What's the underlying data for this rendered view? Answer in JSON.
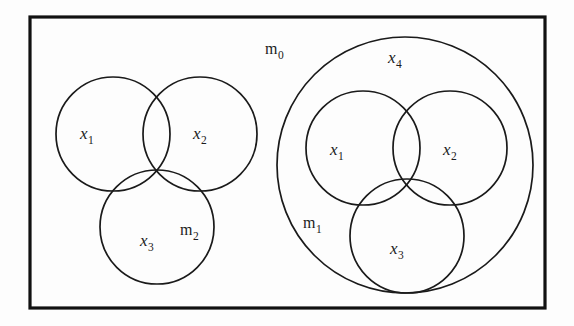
{
  "figure": {
    "background_color": "#fdfdfd",
    "stroke_color": "#1a1a1a",
    "frame_color": "#111111",
    "frame": {
      "x": 30,
      "y": 17,
      "width": 515,
      "height": 291
    },
    "universe_label": {
      "base": "m",
      "sub": "0",
      "x": 265,
      "y": 54
    },
    "groups": [
      {
        "name": "left-group",
        "has_outer_circle": false,
        "circles": [
          {
            "name": "left-circle-x1",
            "cx": 113,
            "cy": 134,
            "r": 57
          },
          {
            "name": "left-circle-x2",
            "cx": 200,
            "cy": 134,
            "r": 57
          },
          {
            "name": "left-circle-x3",
            "cx": 157,
            "cy": 227,
            "r": 57
          }
        ],
        "labels": [
          {
            "name": "left-label-x1",
            "base": "x",
            "sub": "1",
            "x": 80,
            "y": 139,
            "kind": "var"
          },
          {
            "name": "left-label-x2",
            "base": "x",
            "sub": "2",
            "x": 193,
            "y": 139,
            "kind": "var"
          },
          {
            "name": "left-label-x3",
            "base": "x",
            "sub": "3",
            "x": 140,
            "y": 246,
            "kind": "var"
          },
          {
            "name": "left-label-m2",
            "base": "m",
            "sub": "2",
            "x": 180,
            "y": 235,
            "kind": "m"
          }
        ]
      },
      {
        "name": "right-group",
        "has_outer_circle": true,
        "outer_circle": {
          "name": "right-circle-x4",
          "cx": 405,
          "cy": 165,
          "r": 128
        },
        "circles": [
          {
            "name": "right-circle-x1",
            "cx": 363,
            "cy": 148,
            "r": 57
          },
          {
            "name": "right-circle-x2",
            "cx": 450,
            "cy": 148,
            "r": 57
          },
          {
            "name": "right-circle-x3",
            "cx": 407,
            "cy": 236,
            "r": 57
          }
        ],
        "labels": [
          {
            "name": "right-label-x4",
            "base": "x",
            "sub": "4",
            "x": 388,
            "y": 63,
            "kind": "var"
          },
          {
            "name": "right-label-x1",
            "base": "x",
            "sub": "1",
            "x": 330,
            "y": 155,
            "kind": "var"
          },
          {
            "name": "right-label-x2",
            "base": "x",
            "sub": "2",
            "x": 443,
            "y": 155,
            "kind": "var"
          },
          {
            "name": "right-label-x3",
            "base": "x",
            "sub": "3",
            "x": 390,
            "y": 254,
            "kind": "var"
          },
          {
            "name": "right-label-m1",
            "base": "m",
            "sub": "1",
            "x": 303,
            "y": 228,
            "kind": "m"
          }
        ]
      }
    ]
  }
}
